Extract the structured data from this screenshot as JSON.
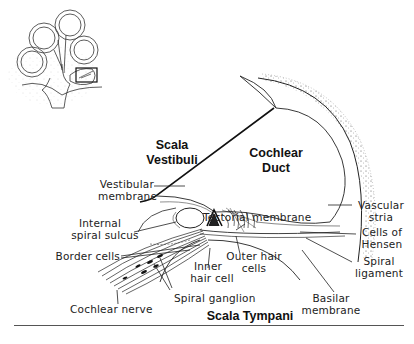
{
  "diagram": {
    "inset": {
      "name": "cochlea-cross-section-thumbnail",
      "highlight_box": "region-of-detail"
    },
    "regions": {
      "scala_vestibuli": [
        "Scala",
        "Vestibuli"
      ],
      "cochlear_duct": [
        "Cochlear",
        "Duct"
      ],
      "scala_tympani": "Scala Tympani"
    },
    "labels": {
      "vestibular_membrane": [
        "Vestibular",
        "membrane"
      ],
      "internal_spiral_sulcus": [
        "Internal",
        "spiral sulcus"
      ],
      "border_cells": "Border cells",
      "tectorial_membrane": "Tectorial membrane",
      "vascular_stria": [
        "Vascular",
        "stria"
      ],
      "cells_of_hensen": [
        "Cells of",
        "Hensen"
      ],
      "spiral_ligament": [
        "Spiral",
        "ligament"
      ],
      "outer_hair_cells": [
        "Outer hair",
        "cells"
      ],
      "inner_hair_cell": [
        "Inner",
        "hair cell"
      ],
      "spiral_ganglion": "Spiral ganglion",
      "cochlear_nerve": "Cochlear nerve",
      "basilar_membrane": [
        "Basilar",
        "membrane"
      ]
    }
  }
}
